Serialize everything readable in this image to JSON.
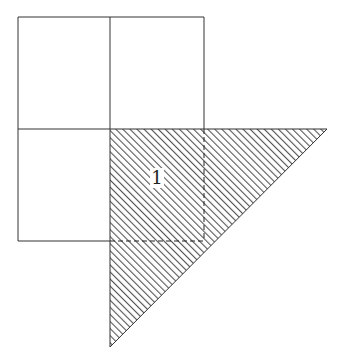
{
  "header": {
    "text": ""
  },
  "diagram": {
    "grid": {
      "left": 18,
      "top": 17,
      "right": 204,
      "bottom": 241,
      "divider_x": 110,
      "divider_y": 129,
      "cells": 4
    },
    "triangle": {
      "vertices": [
        [
          110,
          129
        ],
        [
          327,
          129
        ],
        [
          110,
          347
        ]
      ],
      "fill": "diagonal hatching",
      "hatch_color": "#555555"
    },
    "region_label": "1",
    "label_position": [
      158,
      180
    ],
    "stroke_color": "#333333"
  }
}
